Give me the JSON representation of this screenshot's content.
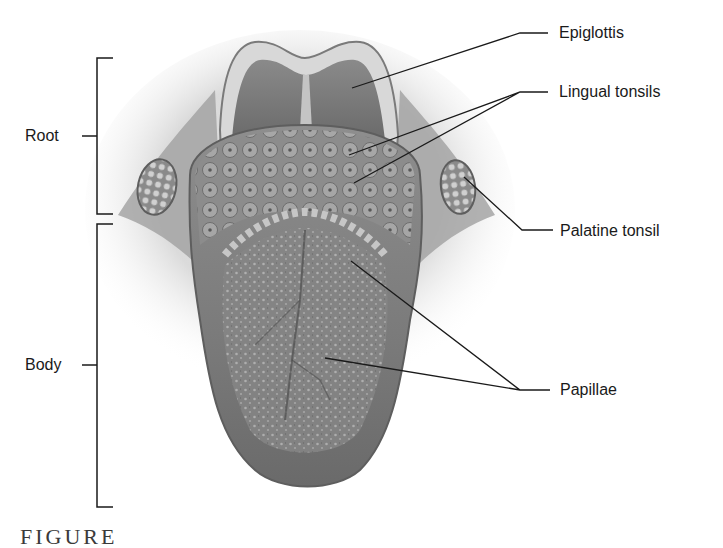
{
  "figure": {
    "caption": "FIGURE",
    "regions": [
      {
        "label": "Root"
      },
      {
        "label": "Body"
      }
    ],
    "callouts": [
      {
        "label": "Epiglottis"
      },
      {
        "label": "Lingual tonsils"
      },
      {
        "label": "Palatine tonsil"
      },
      {
        "label": "Papillae"
      }
    ],
    "colors": {
      "line": "#1a1a1a",
      "tongue_dark": "#6e6e6e",
      "tongue_mid": "#9a9a9a",
      "tongue_light": "#c8c8c8",
      "background": "#ffffff"
    }
  }
}
